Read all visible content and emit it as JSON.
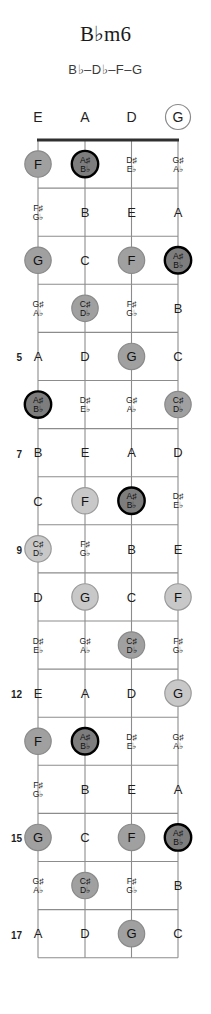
{
  "title": "B♭m6",
  "subtitle": "B♭–D♭–F–G",
  "colors": {
    "root_fill": "#7d7d7d",
    "root_stroke": "#000000",
    "chord_fill": "#a0a0a0",
    "chord_light_fill": "#c8c8c8",
    "open_stroke": "#8a8a8a",
    "fret_line": "#8c8c8c",
    "string_line": "#8c8c8c",
    "nut": "#303030",
    "text": "#1f1f1f"
  },
  "diagram": {
    "instrument": "bass-guitar",
    "open_strings": [
      "E",
      "A",
      "D",
      "G"
    ],
    "open_string_marked": [
      false,
      false,
      false,
      true
    ],
    "fret_numbers_shown": [
      5,
      7,
      9,
      12,
      15,
      17
    ],
    "frets": [
      {
        "fret": 1,
        "label": "",
        "cells": [
          {
            "note": "F",
            "acc": "",
            "mark": "chord"
          },
          {
            "note": "A♯",
            "acc": "B♭",
            "mark": "root"
          },
          {
            "note": "D♯",
            "acc": "E♭",
            "mark": "none"
          },
          {
            "note": "G♯",
            "acc": "A♭",
            "mark": "none"
          }
        ]
      },
      {
        "fret": 2,
        "label": "",
        "cells": [
          {
            "note": "F♯",
            "acc": "G♭",
            "mark": "none"
          },
          {
            "note": "B",
            "acc": "",
            "mark": "none"
          },
          {
            "note": "E",
            "acc": "",
            "mark": "none"
          },
          {
            "note": "A",
            "acc": "",
            "mark": "none"
          }
        ]
      },
      {
        "fret": 3,
        "label": "",
        "cells": [
          {
            "note": "G",
            "acc": "",
            "mark": "chord"
          },
          {
            "note": "C",
            "acc": "",
            "mark": "none"
          },
          {
            "note": "F",
            "acc": "",
            "mark": "chord"
          },
          {
            "note": "A♯",
            "acc": "B♭",
            "mark": "root"
          }
        ]
      },
      {
        "fret": 4,
        "label": "",
        "cells": [
          {
            "note": "G♯",
            "acc": "A♭",
            "mark": "none"
          },
          {
            "note": "C♯",
            "acc": "D♭",
            "mark": "chord"
          },
          {
            "note": "F♯",
            "acc": "G♭",
            "mark": "none"
          },
          {
            "note": "B",
            "acc": "",
            "mark": "none"
          }
        ]
      },
      {
        "fret": 5,
        "label": "5",
        "cells": [
          {
            "note": "A",
            "acc": "",
            "mark": "none"
          },
          {
            "note": "D",
            "acc": "",
            "mark": "none"
          },
          {
            "note": "G",
            "acc": "",
            "mark": "chord"
          },
          {
            "note": "C",
            "acc": "",
            "mark": "none"
          }
        ]
      },
      {
        "fret": 6,
        "label": "",
        "cells": [
          {
            "note": "A♯",
            "acc": "B♭",
            "mark": "root"
          },
          {
            "note": "D♯",
            "acc": "E♭",
            "mark": "none"
          },
          {
            "note": "G♯",
            "acc": "A♭",
            "mark": "none"
          },
          {
            "note": "C♯",
            "acc": "D♭",
            "mark": "chord"
          }
        ]
      },
      {
        "fret": 7,
        "label": "7",
        "cells": [
          {
            "note": "B",
            "acc": "",
            "mark": "none"
          },
          {
            "note": "E",
            "acc": "",
            "mark": "none"
          },
          {
            "note": "A",
            "acc": "",
            "mark": "none"
          },
          {
            "note": "D",
            "acc": "",
            "mark": "none"
          }
        ]
      },
      {
        "fret": 8,
        "label": "",
        "cells": [
          {
            "note": "C",
            "acc": "",
            "mark": "none"
          },
          {
            "note": "F",
            "acc": "",
            "mark": "chord-light"
          },
          {
            "note": "A♯",
            "acc": "B♭",
            "mark": "root"
          },
          {
            "note": "D♯",
            "acc": "E♭",
            "mark": "none"
          }
        ]
      },
      {
        "fret": 9,
        "label": "9",
        "cells": [
          {
            "note": "C♯",
            "acc": "D♭",
            "mark": "chord-light"
          },
          {
            "note": "F♯",
            "acc": "G♭",
            "mark": "none"
          },
          {
            "note": "B",
            "acc": "",
            "mark": "none"
          },
          {
            "note": "E",
            "acc": "",
            "mark": "none"
          }
        ]
      },
      {
        "fret": 10,
        "label": "",
        "cells": [
          {
            "note": "D",
            "acc": "",
            "mark": "none"
          },
          {
            "note": "G",
            "acc": "",
            "mark": "chord-light"
          },
          {
            "note": "C",
            "acc": "",
            "mark": "none"
          },
          {
            "note": "F",
            "acc": "",
            "mark": "chord-light"
          }
        ]
      },
      {
        "fret": 11,
        "label": "",
        "cells": [
          {
            "note": "D♯",
            "acc": "E♭",
            "mark": "none"
          },
          {
            "note": "G♯",
            "acc": "A♭",
            "mark": "none"
          },
          {
            "note": "C♯",
            "acc": "D♭",
            "mark": "chord"
          },
          {
            "note": "F♯",
            "acc": "G♭",
            "mark": "none"
          }
        ]
      },
      {
        "fret": 12,
        "label": "12",
        "cells": [
          {
            "note": "E",
            "acc": "",
            "mark": "none"
          },
          {
            "note": "A",
            "acc": "",
            "mark": "none"
          },
          {
            "note": "D",
            "acc": "",
            "mark": "none"
          },
          {
            "note": "G",
            "acc": "",
            "mark": "chord-light"
          }
        ]
      },
      {
        "fret": 13,
        "label": "",
        "cells": [
          {
            "note": "F",
            "acc": "",
            "mark": "chord"
          },
          {
            "note": "A♯",
            "acc": "B♭",
            "mark": "root"
          },
          {
            "note": "D♯",
            "acc": "E♭",
            "mark": "none"
          },
          {
            "note": "G♯",
            "acc": "A♭",
            "mark": "none"
          }
        ]
      },
      {
        "fret": 14,
        "label": "",
        "cells": [
          {
            "note": "F♯",
            "acc": "G♭",
            "mark": "none"
          },
          {
            "note": "B",
            "acc": "",
            "mark": "none"
          },
          {
            "note": "E",
            "acc": "",
            "mark": "none"
          },
          {
            "note": "A",
            "acc": "",
            "mark": "none"
          }
        ]
      },
      {
        "fret": 15,
        "label": "15",
        "cells": [
          {
            "note": "G",
            "acc": "",
            "mark": "chord"
          },
          {
            "note": "C",
            "acc": "",
            "mark": "none"
          },
          {
            "note": "F",
            "acc": "",
            "mark": "chord"
          },
          {
            "note": "A♯",
            "acc": "B♭",
            "mark": "root"
          }
        ]
      },
      {
        "fret": 16,
        "label": "",
        "cells": [
          {
            "note": "G♯",
            "acc": "A♭",
            "mark": "none"
          },
          {
            "note": "C♯",
            "acc": "D♭",
            "mark": "chord"
          },
          {
            "note": "F♯",
            "acc": "G♭",
            "mark": "none"
          },
          {
            "note": "B",
            "acc": "",
            "mark": "none"
          }
        ]
      },
      {
        "fret": 17,
        "label": "17",
        "cells": [
          {
            "note": "A",
            "acc": "",
            "mark": "none"
          },
          {
            "note": "D",
            "acc": "",
            "mark": "none"
          },
          {
            "note": "G",
            "acc": "",
            "mark": "chord"
          },
          {
            "note": "C",
            "acc": "",
            "mark": "none"
          }
        ]
      }
    ]
  }
}
